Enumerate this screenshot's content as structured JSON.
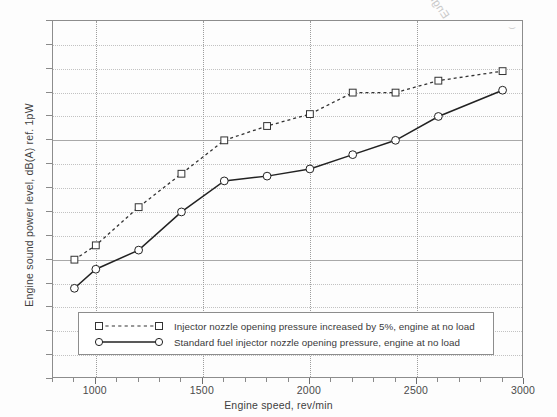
{
  "chart_data": {
    "type": "line",
    "title": "",
    "xlabel": "Engine speed, rev/min",
    "ylabel": "Engine sound power level, dB(A) ref. 1pW",
    "xlim": [
      800,
      3000
    ],
    "ylim": [
      90,
      105
    ],
    "xticks": [
      1000,
      1500,
      2000,
      2500,
      3000
    ],
    "yticks": [
      90,
      95,
      100,
      105
    ],
    "y_minor_step": 1,
    "x_minor_step": 100,
    "grid": true,
    "legend_position": "lower-left-inside",
    "series": [
      {
        "name": "Injector nozzle opening pressure increased by 5%, engine at no load",
        "marker": "square",
        "linestyle": "dotted",
        "color": "#333333",
        "x": [
          900,
          1000,
          1200,
          1400,
          1600,
          1800,
          2000,
          2200,
          2400,
          2600,
          2900
        ],
        "y": [
          95.0,
          95.6,
          97.2,
          98.6,
          100.0,
          100.6,
          101.1,
          102.0,
          102.0,
          102.5,
          102.9
        ]
      },
      {
        "name": "Standard fuel injector nozzle opening pressure, engine at no load",
        "marker": "circle",
        "linestyle": "solid",
        "color": "#222222",
        "x": [
          900,
          1000,
          1200,
          1400,
          1600,
          1800,
          2000,
          2200,
          2400,
          2600,
          2900
        ],
        "y": [
          93.8,
          94.6,
          95.4,
          97.0,
          98.3,
          98.5,
          98.8,
          99.4,
          100.0,
          101.0,
          102.1
        ]
      }
    ]
  },
  "axes": {
    "x_tick_labels": [
      "1000",
      "1500",
      "2000",
      "2500",
      "3000"
    ],
    "y_tick_labels": [
      "105",
      "100",
      "95",
      "90"
    ],
    "x_title": "Engine speed, rev/min",
    "y_title": "Engine sound power level, dB(A) ref. 1pW"
  },
  "legend": {
    "entries": [
      {
        "label": "Injector nozzle opening pressure increased by 5%, engine at no load",
        "marker": "square-marker",
        "style": "dotted"
      },
      {
        "label": "Standard fuel injector nozzle opening pressure, engine at no load",
        "marker": "circle-marker",
        "style": "solid"
      }
    ]
  },
  "watermark": {
    "ghost_text": "Engine noise 203",
    "ghost_mark": "⌣"
  },
  "colors": {
    "axis": "#8d8d8d",
    "grid_minor": "#c2c2c2",
    "grid_major": "#a9a9a9",
    "series_1": "#333333",
    "series_2": "#222222",
    "text": "#3a3a3a",
    "background": "#fdfdfd"
  }
}
